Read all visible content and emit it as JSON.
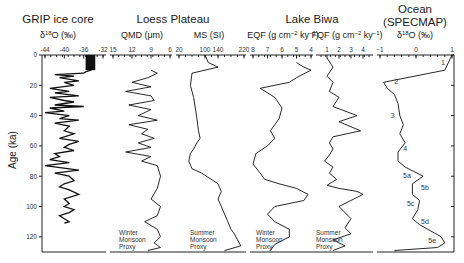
{
  "chart_data": [
    {
      "type": "line",
      "panel": "GRIP ice core",
      "title": "GRIP ice core",
      "xlabel": "δ18O (‰)",
      "ylabel": "Age (ka)",
      "xlim": [
        -44,
        -32
      ],
      "xticks": [
        -44,
        -40,
        -36,
        -32
      ],
      "ylim": [
        0,
        130
      ],
      "yticks": [
        0,
        20,
        40,
        60,
        80,
        100,
        120
      ],
      "x": [
        -35,
        -34,
        -35,
        -34.5,
        -35,
        -34.5,
        -35.5,
        -36,
        -42,
        -38,
        -41,
        -37,
        -40,
        -38,
        -43,
        -39,
        -42,
        -37,
        -43,
        -40,
        -38,
        -42,
        -36,
        -43,
        -40,
        -44,
        -39,
        -41,
        -37,
        -42,
        -39,
        -40,
        -38,
        -41,
        -37,
        -39,
        -40,
        -38,
        -42,
        -41,
        -43,
        -39,
        -44,
        -37,
        -42,
        -39,
        -38,
        -40,
        -41,
        -39,
        -37,
        -40,
        -39,
        -40,
        -38,
        -39,
        -41,
        -40,
        -39,
        -40
      ],
      "y": [
        0,
        2,
        4,
        6,
        8,
        10,
        11,
        12,
        13,
        14,
        15,
        17,
        18,
        20,
        22,
        24,
        25,
        27,
        28,
        30,
        31,
        33,
        34,
        35,
        37,
        38,
        40,
        42,
        43,
        45,
        47,
        50,
        52,
        55,
        57,
        59,
        61,
        63,
        65,
        67,
        69,
        71,
        73,
        76,
        78,
        80,
        83,
        85,
        87,
        89,
        92,
        95,
        98,
        100,
        102,
        104,
        106,
        108,
        110,
        111
      ]
    },
    {
      "type": "line",
      "panel": "Loess Plateau QMD",
      "group": "Loess Plateau",
      "xlabel": "QMD (μm)",
      "xlim": [
        15,
        6
      ],
      "xticks": [
        15,
        12,
        9,
        6
      ],
      "ylim": [
        0,
        130
      ],
      "annotation": "Winter Monsoon Proxy",
      "x": [
        9,
        8,
        9.5,
        12,
        9,
        13,
        9,
        8.5,
        12.5,
        9,
        11,
        8,
        12.5,
        9.5,
        10.5,
        8.5,
        11,
        9,
        13,
        9,
        10.5,
        8,
        7.5,
        8,
        9,
        7.5,
        8,
        10,
        8,
        7.5,
        8.5,
        7.5,
        9.5
      ],
      "y": [
        10,
        12,
        15,
        18,
        21,
        24,
        27,
        30,
        33,
        36,
        40,
        43,
        46,
        49,
        52,
        55,
        58,
        61,
        64,
        67,
        70,
        73,
        80,
        88,
        95,
        100,
        106,
        110,
        115,
        120,
        124,
        127,
        129
      ]
    },
    {
      "type": "line",
      "panel": "Loess Plateau MS",
      "group": "Loess Plateau",
      "xlabel": "MS (SI)",
      "xlim": [
        20,
        220
      ],
      "xticks": [
        20,
        100,
        140,
        220
      ],
      "ylim": [
        0,
        130
      ],
      "annotation": "Summer Monsoon Proxy",
      "x": [
        100,
        110,
        140,
        60,
        55,
        65,
        70,
        75,
        80,
        85,
        75,
        65,
        55,
        50,
        60,
        90,
        140,
        150,
        140,
        150,
        160,
        170,
        180,
        190,
        200,
        210,
        160
      ],
      "y": [
        0,
        5,
        8,
        12,
        20,
        28,
        35,
        42,
        50,
        55,
        58,
        62,
        65,
        70,
        75,
        78,
        85,
        90,
        95,
        100,
        105,
        110,
        115,
        118,
        122,
        126,
        129
      ]
    },
    {
      "type": "line",
      "panel": "Lake Biwa EQF",
      "group": "Lake Biwa",
      "xlabel": "EQF (g cm-2 ky-1)",
      "xlim": [
        8,
        4
      ],
      "xticks": [
        8,
        7,
        6,
        5,
        4
      ],
      "ylim": [
        0,
        130
      ],
      "annotation": "Winter Monsoon Proxy",
      "x": [
        5,
        4.5,
        4,
        5,
        5.5,
        7.5,
        6.5,
        6,
        6.2,
        6.8,
        6.5,
        7,
        7.8,
        8,
        7.5,
        7.2,
        6.2,
        5,
        4.2,
        4.5,
        6.5,
        7,
        6.5,
        5.5,
        5.5,
        6.5,
        6.8
      ],
      "y": [
        5,
        8,
        10,
        15,
        18,
        22,
        28,
        35,
        42,
        50,
        55,
        60,
        65,
        72,
        78,
        82,
        85,
        88,
        92,
        96,
        100,
        105,
        110,
        115,
        120,
        125,
        129
      ]
    },
    {
      "type": "line",
      "panel": "Lake Biwa FQF",
      "group": "Lake Biwa",
      "xlabel": "FQF (g cm-2 ky-1)",
      "xlim": [
        0.5,
        4.5
      ],
      "xticks": [
        1,
        2,
        3,
        4
      ],
      "ylim": [
        0,
        130
      ],
      "annotation": "Summer Monsoon Proxy",
      "x": [
        1,
        1.5,
        1,
        1.5,
        1.2,
        2,
        1.5,
        3.5,
        2,
        3.8,
        1.5,
        1.2,
        1.5,
        1.2,
        0.8,
        1.5,
        1.2,
        1.8,
        1.4,
        1,
        2,
        3.5,
        4,
        2,
        3,
        2.5,
        3,
        1.5,
        2.5,
        1.5
      ],
      "y": [
        2,
        8,
        14,
        18,
        24,
        28,
        34,
        40,
        44,
        50,
        54,
        58,
        62,
        66,
        70,
        74,
        78,
        82,
        84,
        86,
        88,
        90,
        92,
        100,
        108,
        114,
        118,
        122,
        126,
        129
      ]
    },
    {
      "type": "line",
      "panel": "Ocean (SPECMAP)",
      "group": "Ocean (SPECMAP)",
      "xlabel": "δ18O (‰)",
      "xlim": [
        -1,
        1
      ],
      "xticks": [
        -1,
        0,
        1
      ],
      "ylim": [
        0,
        130
      ],
      "stage_labels": [
        "1",
        "2",
        "3",
        "4",
        "5a",
        "5b",
        "5c",
        "5d",
        "5e"
      ],
      "stage_ages": [
        5,
        18,
        40,
        62,
        80,
        90,
        100,
        110,
        122
      ],
      "x": [
        1,
        0.9,
        0.8,
        -0.9,
        -0.8,
        -0.6,
        -0.5,
        -0.45,
        -0.35,
        -0.45,
        -0.3,
        -0.5,
        -0.5,
        -0.3,
        0.2,
        -0.1,
        -0.1,
        0.1,
        0.05,
        -0.1,
        0.1,
        0.7,
        0.8,
        0.6,
        -0.6
      ],
      "y": [
        0,
        5,
        10,
        18,
        22,
        26,
        32,
        40,
        46,
        52,
        58,
        64,
        70,
        74,
        80,
        85,
        92,
        96,
        102,
        108,
        112,
        120,
        124,
        127,
        129
      ]
    }
  ],
  "figure": {
    "y_axis": {
      "label": "Age (ka)",
      "ticks": [
        "0",
        "20",
        "40",
        "60",
        "80",
        "100",
        "120"
      ]
    },
    "groups": [
      {
        "title": "GRIP ice core",
        "subtitle_main": "δ",
        "subtitle_sup": "18",
        "subtitle_rest": "O (‰)"
      },
      {
        "title": "Loess Plateau"
      },
      {
        "title": "Lake Biwa"
      },
      {
        "title": "Ocean",
        "title2": "(SPECMAP)"
      }
    ],
    "vars": {
      "qmd": "QMD (μm)",
      "ms": "MS (SI)",
      "eqf": "EQF (g cm",
      "eqf_sup1": "−2",
      "eqf_mid": " ky",
      "eqf_sup2": "−1",
      "eqf_end": ")",
      "fqf": "FQF (g cm",
      "ocean_d": "δ",
      "ocean_sup": "18",
      "ocean_rest": "O (‰)"
    },
    "ticks": {
      "grip": [
        "-44",
        "-40",
        "-36",
        "-32"
      ],
      "qmd": [
        "15",
        "12",
        "9",
        "6"
      ],
      "ms": [
        "20",
        "100",
        "140",
        "220"
      ],
      "eqf": [
        "8",
        "7",
        "6",
        "5",
        "4"
      ],
      "fqf": [
        "1",
        "2",
        "3",
        "4"
      ],
      "ocean": [
        "−1",
        "0",
        "1"
      ]
    },
    "notes": {
      "winter1": "Winter",
      "winter2": "Monsoon",
      "winter3": "Proxy",
      "summer1": "Summer",
      "summer2": "Monsoon",
      "summer3": "Proxy"
    },
    "stages": [
      "1",
      "2",
      "3",
      "4",
      "5a",
      "5b",
      "5c",
      "5d",
      "5e"
    ]
  }
}
